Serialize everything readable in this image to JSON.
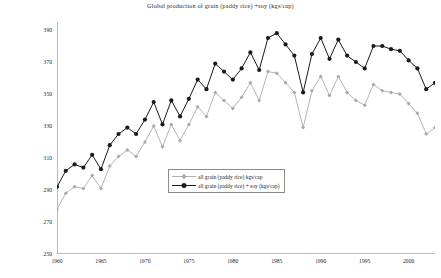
{
  "chart_data": {
    "type": "line",
    "title": "Global production of grain (paddy rice) +soy (kgs/cap)",
    "xlabel": "",
    "ylabel": "kgs per capita",
    "xlim": [
      1960,
      2003
    ],
    "ylim": [
      250,
      395
    ],
    "grid": false,
    "legend_position": "center",
    "y_ticks": [
      250,
      270,
      290,
      310,
      330,
      350,
      370,
      390
    ],
    "x_ticks": [
      1960,
      1965,
      1970,
      1975,
      1980,
      1985,
      1990,
      1995,
      2000
    ],
    "x": [
      1960,
      1961,
      1962,
      1963,
      1964,
      1965,
      1966,
      1967,
      1968,
      1969,
      1970,
      1971,
      1972,
      1973,
      1974,
      1975,
      1976,
      1977,
      1978,
      1979,
      1980,
      1981,
      1982,
      1983,
      1984,
      1985,
      1986,
      1987,
      1988,
      1989,
      1990,
      1991,
      1992,
      1993,
      1994,
      1995,
      1996,
      1997,
      1998,
      1999,
      2000,
      2001,
      2002,
      2003
    ],
    "series": [
      {
        "name": "all grain (paddy rice) kgs/cap",
        "color": "#a8a8a8",
        "marker": "diamond",
        "values": [
          278,
          288,
          292,
          291,
          299,
          291,
          305,
          311,
          315,
          311,
          320,
          330,
          317,
          331,
          321,
          331,
          342,
          336,
          351,
          346,
          341,
          348,
          357,
          346,
          364,
          363,
          357,
          351,
          329,
          352,
          361,
          349,
          361,
          351,
          346,
          343,
          356,
          352,
          351,
          350,
          344,
          338,
          325,
          329
        ]
      },
      {
        "name": "all grain (paddy rice) + soy (kgs/cap)",
        "color": "#1a1a1a",
        "marker": "circle",
        "values": [
          292,
          302,
          306,
          304,
          312,
          303,
          318,
          325,
          329,
          325,
          334,
          345,
          331,
          346,
          336,
          347,
          359,
          353,
          369,
          364,
          359,
          366,
          376,
          365,
          385,
          388,
          381,
          374,
          351,
          375,
          385,
          372,
          384,
          374,
          370,
          366,
          380,
          380,
          378,
          377,
          371,
          366,
          353,
          357
        ]
      }
    ]
  },
  "legend": {
    "items": [
      {
        "label": "all grain (paddy rice) kgs/cap"
      },
      {
        "label": "all grain (paddy rice) + soy (kgs/cap)"
      }
    ]
  }
}
